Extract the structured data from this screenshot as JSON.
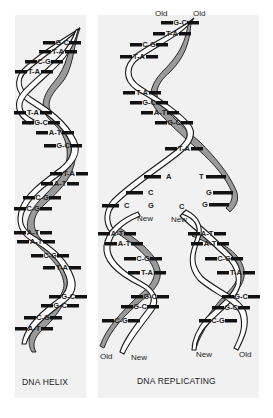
{
  "figure": {
    "left_panel": {
      "caption": "DNA HELIX",
      "base_pairs": [
        {
          "label": "G-C",
          "x": 62,
          "y": 44
        },
        {
          "label": "T-A",
          "x": 58,
          "y": 53
        },
        {
          "label": "C-G",
          "x": 44,
          "y": 63
        },
        {
          "label": "T-A",
          "x": 34,
          "y": 73
        },
        {
          "label": "T-A",
          "x": 33,
          "y": 114
        },
        {
          "label": "G-C",
          "x": 41,
          "y": 124
        },
        {
          "label": "A-T",
          "x": 55,
          "y": 134
        },
        {
          "label": "G-C",
          "x": 63,
          "y": 147
        },
        {
          "label": "T-A",
          "x": 69,
          "y": 175
        },
        {
          "label": "A-T",
          "x": 60,
          "y": 185
        },
        {
          "label": "C-G",
          "x": 42,
          "y": 199
        },
        {
          "label": "C-G",
          "x": 33,
          "y": 210
        },
        {
          "label": "A-T",
          "x": 33,
          "y": 234
        },
        {
          "label": "A-T",
          "x": 36,
          "y": 243
        },
        {
          "label": "C-G",
          "x": 50,
          "y": 257
        },
        {
          "label": "T-A",
          "x": 62,
          "y": 269
        },
        {
          "label": "G-C",
          "x": 68,
          "y": 298
        },
        {
          "label": "G-C",
          "x": 60,
          "y": 307
        },
        {
          "label": "C-G",
          "x": 43,
          "y": 319
        },
        {
          "label": "A-T",
          "x": 34,
          "y": 330
        }
      ]
    },
    "right_panel": {
      "caption": "DNA REPLICATING",
      "top_labels": [
        {
          "text": "Old",
          "x": 155,
          "y": 16
        },
        {
          "text": "Old",
          "x": 193,
          "y": 16
        }
      ],
      "base_pairs": [
        {
          "label": "G-C",
          "x": 180,
          "y": 24
        },
        {
          "label": "T-A",
          "x": 172,
          "y": 35
        },
        {
          "label": "C-G",
          "x": 149,
          "y": 46
        },
        {
          "label": "T-A",
          "x": 139,
          "y": 58
        },
        {
          "label": "T-A",
          "x": 142,
          "y": 94
        },
        {
          "label": "G-C",
          "x": 149,
          "y": 104
        },
        {
          "label": "A-T",
          "x": 160,
          "y": 114
        },
        {
          "label": "G-C",
          "x": 174,
          "y": 124
        },
        {
          "label": "T-A",
          "x": 184,
          "y": 150
        }
      ],
      "unpaired_left": [
        {
          "label": "A",
          "x": 166,
          "y": 178
        },
        {
          "label": "C",
          "x": 148,
          "y": 194
        },
        {
          "label": "C",
          "x": 124,
          "y": 207
        },
        {
          "label": "G",
          "x": 148,
          "y": 207
        }
      ],
      "unpaired_right": [
        {
          "label": "T",
          "x": 199,
          "y": 178
        },
        {
          "label": "G",
          "x": 206,
          "y": 194
        },
        {
          "label": "G",
          "x": 202,
          "y": 206
        },
        {
          "label": "C",
          "x": 179,
          "y": 208
        }
      ],
      "mid_labels": [
        {
          "text": "New",
          "x": 137,
          "y": 221
        },
        {
          "text": "New",
          "x": 171,
          "y": 222
        }
      ],
      "left_daughter_pairs": [
        {
          "label": "A-T",
          "x": 117,
          "y": 235
        },
        {
          "label": "A-T",
          "x": 124,
          "y": 245
        },
        {
          "label": "C-G",
          "x": 143,
          "y": 260
        },
        {
          "label": "T-A",
          "x": 147,
          "y": 274
        },
        {
          "label": "G-C",
          "x": 150,
          "y": 298
        },
        {
          "label": "G-C",
          "x": 140,
          "y": 308
        },
        {
          "label": "C-G",
          "x": 121,
          "y": 322
        }
      ],
      "right_daughter_pairs": [
        {
          "label": "A-T",
          "x": 207,
          "y": 235
        },
        {
          "label": "A-T",
          "x": 210,
          "y": 245
        },
        {
          "label": "C-G",
          "x": 224,
          "y": 260
        },
        {
          "label": "T-A",
          "x": 236,
          "y": 274
        },
        {
          "label": "G-C",
          "x": 241,
          "y": 298
        },
        {
          "label": "G-C",
          "x": 231,
          "y": 309
        },
        {
          "label": "C-G",
          "x": 218,
          "y": 322
        }
      ],
      "bottom_labels": [
        {
          "text": "Old",
          "x": 100,
          "y": 359
        },
        {
          "text": "New",
          "x": 131,
          "y": 360
        },
        {
          "text": "New",
          "x": 196,
          "y": 357
        },
        {
          "text": "Old",
          "x": 239,
          "y": 357
        }
      ]
    }
  }
}
